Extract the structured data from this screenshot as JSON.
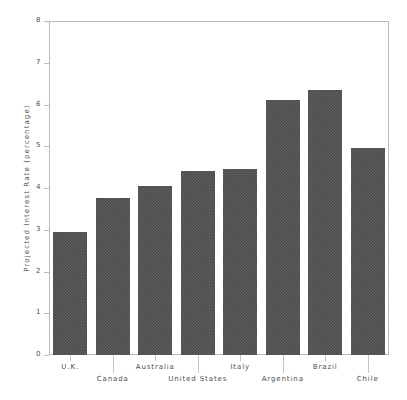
{
  "chart_data": {
    "type": "bar",
    "title": "",
    "subtitle": "",
    "xlabel": "",
    "ylabel": "Projected Interest Rate (percentage)",
    "categories": [
      "U.K.",
      "Canada",
      "Australia",
      "United States",
      "Italy",
      "Argentina",
      "Brazil",
      "Chile"
    ],
    "values": [
      2.95,
      3.75,
      4.05,
      4.4,
      4.45,
      6.1,
      6.35,
      4.95
    ],
    "series": [
      {
        "name": "Projected Interest Rate",
        "values": [
          2.95,
          3.75,
          4.05,
          4.4,
          4.45,
          6.1,
          6.35,
          4.95
        ]
      }
    ],
    "ylim": [
      0,
      8
    ],
    "yticks": [
      0,
      1,
      2,
      3,
      4,
      5,
      6,
      7,
      8
    ],
    "ytick_labels": [
      "0",
      "1",
      "2",
      "3",
      "4",
      "5",
      "6",
      "7",
      "8"
    ],
    "grid": false,
    "legend": false,
    "legend_position": "none",
    "bar_color": "#4c4c4c",
    "frame_color": "#b9b9b9",
    "text_color": "#4d4d4d",
    "background_color": "#ffffff",
    "xtick_label_rows": [
      0,
      1,
      0,
      1,
      0,
      1,
      0,
      1
    ]
  }
}
